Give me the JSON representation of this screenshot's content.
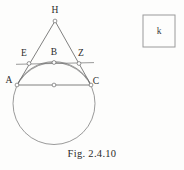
{
  "figure": {
    "caption": "Fig. 2.4.10",
    "legend_box_label": "k",
    "points": [
      {
        "id": "H",
        "label": "H",
        "x": 55,
        "y": 21,
        "label_x": 55,
        "label_y": 13
      },
      {
        "id": "E",
        "label": "E",
        "x": 29,
        "y": 63.5,
        "label_x": 24,
        "label_y": 56
      },
      {
        "id": "B",
        "label": "B",
        "x": 54,
        "y": 62.5,
        "label_x": 54,
        "label_y": 55
      },
      {
        "id": "Z",
        "label": "Z",
        "x": 79,
        "y": 63.5,
        "label_x": 81,
        "label_y": 56
      },
      {
        "id": "A",
        "label": "A",
        "x": 17,
        "y": 85,
        "label_x": 9,
        "label_y": 83
      },
      {
        "id": "C",
        "label": "C",
        "x": 91,
        "y": 85,
        "label_x": 96,
        "label_y": 84
      },
      {
        "id": "O",
        "label": "",
        "x": 54,
        "y": 85,
        "label_x": 54,
        "label_y": 85
      }
    ],
    "circle": {
      "cx": 54,
      "cy": 103.5,
      "r": 41
    },
    "segments": [
      {
        "name": "side-HA",
        "from": "H",
        "to": "A"
      },
      {
        "name": "side-HC",
        "from": "H",
        "to": "C"
      },
      {
        "name": "chord-AC",
        "from": "A",
        "to": "C"
      }
    ],
    "tangent_line": {
      "name": "tangent-EZ",
      "x1": 16,
      "y1": 64.3,
      "x2": 94,
      "y2": 62.6
    },
    "arc_ABC": {
      "name": "arc-A-B-C",
      "path": "M 17 85 A 41 41 0 0 1 91 85"
    },
    "legend_box": {
      "x": 143,
      "y": 15,
      "width": 32,
      "height": 32
    }
  }
}
